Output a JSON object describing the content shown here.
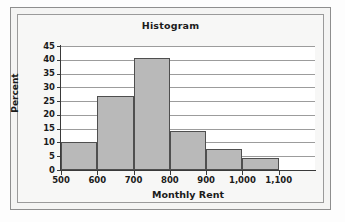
{
  "figure": {
    "title": "Histogram",
    "frame_color": "#8e8e8e",
    "background_color": "#f4f4f3"
  },
  "chart_data": {
    "type": "bar",
    "title": "Histogram",
    "xlabel": "Monthly Rent",
    "ylabel": "Percent",
    "xlim": [
      500,
      1200
    ],
    "ylim": [
      0,
      45
    ],
    "grid": true,
    "legend": null,
    "bar_color": "#b9b9b9",
    "bar_edge_color": "#4f4f4f",
    "bin_width": 100,
    "categories": [
      "500-600",
      "600-700",
      "700-800",
      "800-900",
      "900-1,000",
      "1,000-1,100"
    ],
    "bin_edges": [
      500,
      600,
      700,
      800,
      900,
      1000,
      1100
    ],
    "values": [
      10,
      27,
      40.5,
      14,
      7.5,
      4.5
    ],
    "xticks": [
      500,
      600,
      700,
      800,
      900,
      1000,
      1100
    ],
    "xtick_labels": [
      "500",
      "600",
      "700",
      "800",
      "900",
      "1,000",
      "1,100"
    ],
    "yticks": [
      0,
      5,
      10,
      15,
      20,
      25,
      30,
      35,
      40,
      45
    ],
    "ytick_labels": [
      "0",
      "5",
      "10",
      "15",
      "20",
      "25",
      "30",
      "35",
      "40",
      "45"
    ]
  }
}
